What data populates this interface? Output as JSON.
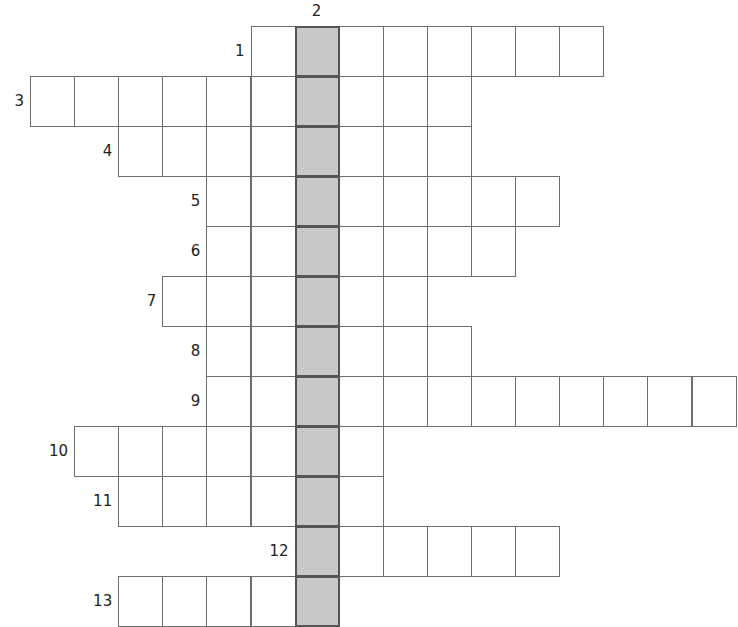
{
  "puzzle": {
    "type": "crossword",
    "cell_width": 44.1,
    "row_height": 50,
    "origin_x": 30,
    "origin_y": 26,
    "shaded_column": 6,
    "shaded_color": "#c8c8c8",
    "clue_down": {
      "number": "2",
      "col": 6,
      "row_start": 0,
      "row_end": 11
    },
    "rows": [
      {
        "number": "1",
        "start_col": 5,
        "length": 8
      },
      {
        "number": "3",
        "start_col": 0,
        "length": 10
      },
      {
        "number": "4",
        "start_col": 2,
        "length": 8
      },
      {
        "number": "5",
        "start_col": 4,
        "length": 8
      },
      {
        "number": "6",
        "start_col": 4,
        "length": 7
      },
      {
        "number": "7",
        "start_col": 3,
        "length": 6
      },
      {
        "number": "8",
        "start_col": 4,
        "length": 6
      },
      {
        "number": "9",
        "start_col": 4,
        "length": 12
      },
      {
        "number": "10",
        "start_col": 1,
        "length": 7
      },
      {
        "number": "11",
        "start_col": 2,
        "length": 6
      },
      {
        "number": "12",
        "start_col": 6,
        "length": 6
      },
      {
        "number": "13",
        "start_col": 2,
        "length": 5
      }
    ]
  }
}
